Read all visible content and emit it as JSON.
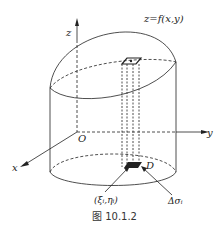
{
  "diagram": {
    "surface_label": "z=f(x,y)",
    "axes": {
      "x": "x",
      "y": "y",
      "z": "z",
      "origin": "O"
    },
    "region_label": "D",
    "point_label": "(ξ_i,η_i)",
    "point_label_display": "(ξᵢ,ηᵢ)",
    "area_element_label": "Δσ_i",
    "area_element_display": "Δσᵢ",
    "caption": "图 10.1.2"
  }
}
